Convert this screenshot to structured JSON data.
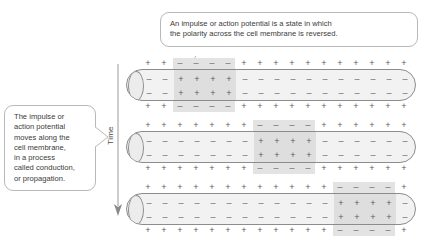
{
  "figure": {
    "type": "diagram"
  },
  "callouts": {
    "top": {
      "name": "impulse-definition-callout",
      "lines": [
        "An impulse or action potential is a state in which",
        "the polarity across the cell membrane is reversed."
      ]
    },
    "left": {
      "name": "conduction-callout",
      "lines": [
        "The impulse or",
        "action potential",
        "moves along the",
        "cell membrane,",
        "in a process",
        "called conduction,",
        "or propagation."
      ]
    }
  },
  "axis": {
    "label": "Time",
    "direction": "down",
    "arrow_icon": "down-arrow-icon"
  },
  "symbols": {
    "plus": "+",
    "minus": "–"
  },
  "colors": {
    "outline": "#8c8c8c",
    "membrane_fill": "#f2f2f2",
    "highlight": "#e3e3e3",
    "text": "#3b3b3b",
    "symbol": "#5c5c5c",
    "bubble_border": "#b8b8b8"
  },
  "chart_data": {
    "type": "diagram",
    "xlabel": "Position along axon",
    "ylabel": "Time",
    "columns": 17,
    "stages": [
      {
        "index": 0,
        "name": "stage-1-impulse-at-left",
        "time_order": 1,
        "depolarized_columns": [
          2,
          3,
          4,
          5
        ],
        "outside_top": [
          "+",
          "+",
          "–",
          "–",
          "–",
          "–",
          "+",
          "+",
          "+",
          "+",
          "+",
          "+",
          "+",
          "+",
          "+",
          "+",
          "+"
        ],
        "inside_upper": [
          "–",
          "–",
          "+",
          "+",
          "+",
          "+",
          "–",
          "–",
          "–",
          "–",
          "–",
          "–",
          "–",
          "–",
          "–",
          "–",
          "–"
        ],
        "inside_lower": [
          "–",
          "–",
          "+",
          "+",
          "+",
          "+",
          "–",
          "–",
          "–",
          "–",
          "–",
          "–",
          "–",
          "–",
          "–",
          "–",
          "–"
        ],
        "outside_bottom": [
          "+",
          "+",
          "–",
          "–",
          "–",
          "–",
          "+",
          "+",
          "+",
          "+",
          "+",
          "+",
          "+",
          "+",
          "+",
          "+",
          "+"
        ]
      },
      {
        "index": 1,
        "name": "stage-2-impulse-at-middle",
        "time_order": 2,
        "depolarized_columns": [
          7,
          8,
          9,
          10
        ],
        "outside_top": [
          "+",
          "+",
          "+",
          "+",
          "+",
          "+",
          "+",
          "–",
          "–",
          "–",
          "–",
          "+",
          "+",
          "+",
          "+",
          "+",
          "+"
        ],
        "inside_upper": [
          "–",
          "–",
          "–",
          "–",
          "–",
          "–",
          "–",
          "+",
          "+",
          "+",
          "+",
          "–",
          "–",
          "–",
          "–",
          "–",
          "–"
        ],
        "inside_lower": [
          "–",
          "–",
          "–",
          "–",
          "–",
          "–",
          "–",
          "+",
          "+",
          "+",
          "+",
          "–",
          "–",
          "–",
          "–",
          "–",
          "–"
        ],
        "outside_bottom": [
          "+",
          "+",
          "+",
          "+",
          "+",
          "+",
          "+",
          "–",
          "–",
          "–",
          "–",
          "+",
          "+",
          "+",
          "+",
          "+",
          "+"
        ]
      },
      {
        "index": 2,
        "name": "stage-3-impulse-at-right",
        "time_order": 3,
        "depolarized_columns": [
          12,
          13,
          14,
          15
        ],
        "outside_top": [
          "+",
          "+",
          "+",
          "+",
          "+",
          "+",
          "+",
          "+",
          "+",
          "+",
          "+",
          "+",
          "–",
          "–",
          "–",
          "–",
          "+"
        ],
        "inside_upper": [
          "–",
          "–",
          "–",
          "–",
          "–",
          "–",
          "–",
          "–",
          "–",
          "–",
          "–",
          "–",
          "+",
          "+",
          "+",
          "+",
          "–"
        ],
        "inside_lower": [
          "–",
          "–",
          "–",
          "–",
          "–",
          "–",
          "–",
          "–",
          "–",
          "–",
          "–",
          "–",
          "+",
          "+",
          "+",
          "+",
          "–"
        ],
        "outside_bottom": [
          "+",
          "+",
          "+",
          "+",
          "+",
          "+",
          "+",
          "+",
          "+",
          "+",
          "+",
          "+",
          "–",
          "–",
          "–",
          "–",
          "+"
        ]
      }
    ]
  }
}
